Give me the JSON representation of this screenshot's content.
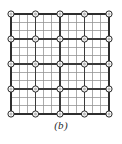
{
  "figure": {
    "caption": "(b)",
    "type": "finite-element-mesh"
  },
  "mesh": {
    "domain_left": 11,
    "domain_top": 14,
    "domain_right": 109,
    "domain_bottom": 114,
    "fine_divisions_x": 12,
    "fine_divisions_y": 12,
    "coarse_divisions_x": 4,
    "coarse_divisions_y": 4,
    "node_rows": 5,
    "node_cols": 5,
    "node_count": 25,
    "node_radius": 3.1,
    "node_inner_radius": 1.5
  },
  "colors": {
    "background": "#ffffff",
    "fine_line": "#8f8f8f",
    "coarse_line": "#3a3a3a",
    "border_line": "#2e2e2e",
    "node_stroke": "#2b2b2b",
    "node_fill": "#ffffff",
    "node_inner_fill": "#b9b9b9",
    "caption_text": "#2b2b2b"
  },
  "strokes": {
    "fine_width": 0.75,
    "coarse_width": 1.15,
    "border_width": 1.3,
    "node_width": 1.0
  }
}
